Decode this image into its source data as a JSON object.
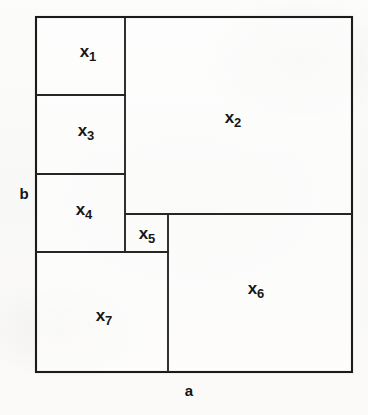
{
  "figure": {
    "outer": {
      "x": 36,
      "y": 17,
      "width": 316,
      "height": 355,
      "stroke_color": "#1b1b1b",
      "stroke_width": 2,
      "fill_color": "#ffffff"
    },
    "dimension_labels": [
      {
        "id": "label-a",
        "text": "a",
        "side": "bottom",
        "x": 189,
        "y": 390
      },
      {
        "id": "label-b",
        "text": "b",
        "side": "left",
        "x": 24,
        "y": 193
      }
    ],
    "cells": [
      {
        "id": "x1",
        "base": "x",
        "sub": "1",
        "x": 36,
        "y": 17,
        "width": 89,
        "height": 78,
        "label_x": 88,
        "label_y": 52
      },
      {
        "id": "x2",
        "base": "x",
        "sub": "2",
        "x": 125,
        "y": 17,
        "width": 227,
        "height": 197,
        "label_x": 233,
        "label_y": 118
      },
      {
        "id": "x3",
        "base": "x",
        "sub": "3",
        "x": 36,
        "y": 95,
        "width": 89,
        "height": 79,
        "label_x": 86,
        "label_y": 131
      },
      {
        "id": "x4",
        "base": "x",
        "sub": "4",
        "x": 36,
        "y": 174,
        "width": 89,
        "height": 78,
        "label_x": 84,
        "label_y": 210
      },
      {
        "id": "x5",
        "base": "x",
        "sub": "5",
        "x": 125,
        "y": 214,
        "width": 43,
        "height": 38,
        "label_x": 147,
        "label_y": 234
      },
      {
        "id": "x6",
        "base": "x",
        "sub": "6",
        "x": 168,
        "y": 214,
        "width": 184,
        "height": 158,
        "label_x": 256,
        "label_y": 289
      },
      {
        "id": "x7",
        "base": "x",
        "sub": "7",
        "x": 36,
        "y": 252,
        "width": 132,
        "height": 120,
        "label_x": 104,
        "label_y": 316
      }
    ],
    "interior_edges": [
      {
        "id": "edge-x1-x3",
        "orientation": "horizontal",
        "x1": 36,
        "y1": 95,
        "x2": 125,
        "y2": 95
      },
      {
        "id": "edge-x3-x4",
        "orientation": "horizontal",
        "x1": 36,
        "y1": 174,
        "x2": 125,
        "y2": 174
      },
      {
        "id": "edge-x2-x6",
        "orientation": "horizontal",
        "x1": 125,
        "y1": 214,
        "x2": 352,
        "y2": 214
      },
      {
        "id": "edge-x4x5-x7",
        "orientation": "horizontal",
        "x1": 36,
        "y1": 252,
        "x2": 168,
        "y2": 252
      },
      {
        "id": "edge-left-col-x2",
        "orientation": "vertical",
        "x1": 125,
        "y1": 17,
        "x2": 125,
        "y2": 252
      },
      {
        "id": "edge-x7-x6",
        "orientation": "vertical",
        "x1": 168,
        "y1": 214,
        "x2": 168,
        "y2": 372
      }
    ]
  }
}
